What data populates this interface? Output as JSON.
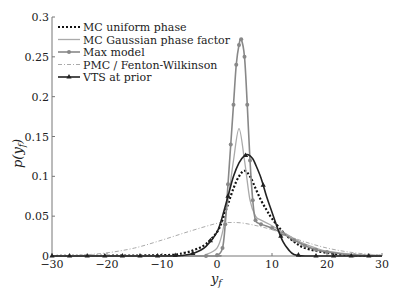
{
  "chart_data": {
    "type": "line",
    "title": "",
    "xlabel": "y_f",
    "ylabel": "p(y_f)",
    "xlim": [
      -30,
      30
    ],
    "ylim": [
      0,
      0.3
    ],
    "xticks": [
      -30,
      -20,
      -10,
      0,
      10,
      20,
      30
    ],
    "yticks": [
      0,
      0.05,
      0.1,
      0.15,
      0.2,
      0.25,
      0.3
    ],
    "ytick_labels": [
      "0",
      "0.05",
      "0.1",
      "0.15",
      "0.2",
      "0.25",
      "0.3"
    ],
    "grid": false,
    "legend_position": "upper left",
    "series": [
      {
        "name": "MC uniform phase",
        "style": "dotted",
        "color": "#111111",
        "x": [
          -30,
          -10,
          -6,
          -4,
          -2,
          0,
          1,
          2,
          3,
          4,
          5,
          6,
          7,
          8,
          9,
          10,
          12,
          14,
          16,
          20,
          25,
          30
        ],
        "y": [
          0,
          0.001,
          0.004,
          0.008,
          0.015,
          0.03,
          0.045,
          0.065,
          0.085,
          0.1,
          0.107,
          0.1,
          0.085,
          0.07,
          0.058,
          0.047,
          0.03,
          0.018,
          0.01,
          0.004,
          0.001,
          0
        ]
      },
      {
        "name": "MC Gaussian phase factor",
        "style": "solid",
        "color": "#aaaaaa",
        "x": [
          -30,
          -4,
          -2,
          0,
          1,
          2,
          3,
          4,
          5,
          6,
          7,
          8,
          10,
          12,
          14,
          16,
          18,
          20,
          25,
          30
        ],
        "y": [
          0,
          0,
          0.002,
          0.01,
          0.03,
          0.07,
          0.12,
          0.16,
          0.12,
          0.07,
          0.05,
          0.045,
          0.038,
          0.03,
          0.022,
          0.015,
          0.01,
          0.006,
          0.002,
          0
        ]
      },
      {
        "name": "Max model",
        "style": "solid-marker",
        "color": "#888888",
        "x": [
          -30,
          -2,
          0,
          1,
          1.5,
          2,
          2.5,
          3,
          3.5,
          4,
          4.4,
          5,
          5.5,
          6,
          6.5,
          7,
          8,
          10,
          12,
          14,
          16,
          18,
          20,
          25,
          30
        ],
        "y": [
          0,
          0,
          0.001,
          0.01,
          0.04,
          0.09,
          0.14,
          0.19,
          0.24,
          0.265,
          0.272,
          0.25,
          0.19,
          0.12,
          0.07,
          0.045,
          0.04,
          0.035,
          0.028,
          0.02,
          0.013,
          0.008,
          0.005,
          0.001,
          0
        ]
      },
      {
        "name": "PMC / Fenton-Wilkinson",
        "style": "dash-dot",
        "color": "#aaaaaa",
        "x": [
          -30,
          -25,
          -20,
          -15,
          -10,
          -5,
          0,
          2,
          5,
          10,
          15,
          20,
          25,
          30
        ],
        "y": [
          0,
          0.001,
          0.004,
          0.01,
          0.02,
          0.031,
          0.041,
          0.042,
          0.041,
          0.033,
          0.02,
          0.01,
          0.004,
          0.001
        ]
      },
      {
        "name": "VTS at prior",
        "style": "solid-triangle",
        "color": "#222222",
        "x": [
          -30,
          -10,
          -6,
          -4,
          -2,
          0,
          1,
          2,
          3,
          4,
          5,
          5.7,
          6.5,
          7,
          8,
          9,
          10,
          11,
          12,
          13,
          14,
          16,
          20,
          25,
          30
        ],
        "y": [
          0,
          0,
          0.001,
          0.004,
          0.012,
          0.03,
          0.05,
          0.075,
          0.1,
          0.117,
          0.126,
          0.127,
          0.122,
          0.115,
          0.098,
          0.075,
          0.055,
          0.035,
          0.018,
          0.008,
          0.002,
          0,
          0,
          0,
          0
        ]
      }
    ]
  },
  "legend": {
    "items": [
      {
        "label": "MC uniform phase"
      },
      {
        "label": "MC Gaussian phase factor"
      },
      {
        "label": "Max model"
      },
      {
        "label": "PMC / Fenton-Wilkinson"
      },
      {
        "label": "VTS at prior"
      }
    ]
  },
  "axes": {
    "xlabel": "y",
    "xlabel_sub": "f",
    "ylabel": "p(y",
    "ylabel_sub": "f",
    "ylabel_close": ")"
  }
}
